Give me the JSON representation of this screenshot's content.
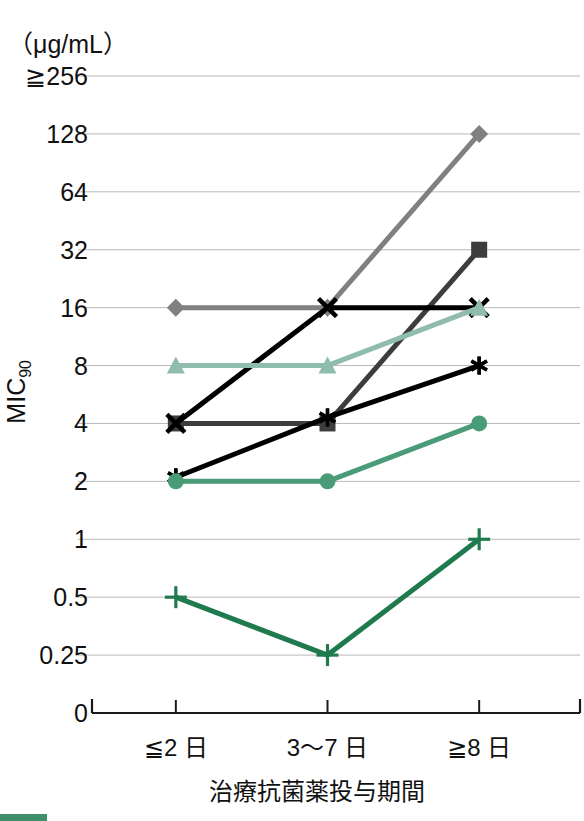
{
  "axis": {
    "unit_label": "（μg/mL）",
    "y_title": "MIC",
    "y_title_sub": "90",
    "x_title": "治療抗菌薬投与期間"
  },
  "chart_data": {
    "type": "line",
    "title": "",
    "xlabel": "治療抗菌薬投与期間",
    "ylabel": "MIC90",
    "unit": "μg/mL",
    "categories": [
      "≦2 日",
      "3〜7 日",
      "≧8 日"
    ],
    "y_scale": "log2",
    "y_ticks": [
      "≧256",
      "128",
      "64",
      "32",
      "16",
      "8",
      "4",
      "2",
      "1",
      "0.5",
      "0.25",
      "0"
    ],
    "y_tick_values": [
      256,
      128,
      64,
      32,
      16,
      8,
      4,
      2,
      1,
      0.5,
      0.25,
      0
    ],
    "grid": true,
    "legend": "none",
    "series": [
      {
        "name": "series-diamond-gray",
        "marker": "diamond",
        "color": "#808080",
        "values": [
          16,
          16,
          128
        ]
      },
      {
        "name": "series-square-darkgray",
        "marker": "square",
        "color": "#3d3d3d",
        "values": [
          4,
          4,
          32
        ]
      },
      {
        "name": "series-x-black",
        "marker": "x",
        "color": "#000000",
        "values": [
          4,
          16,
          16
        ]
      },
      {
        "name": "series-triangle-sage",
        "marker": "triangle",
        "color": "#8fbcab",
        "values": [
          8,
          8,
          16
        ]
      },
      {
        "name": "series-asterisk-black",
        "marker": "asterisk",
        "color": "#000000",
        "values": [
          2.1,
          4.3,
          8
        ]
      },
      {
        "name": "series-circle-green",
        "marker": "circle",
        "color": "#4a9b77",
        "values": [
          2,
          2,
          4
        ]
      },
      {
        "name": "series-plus-darkgreen",
        "marker": "plus",
        "color": "#1f7a4d",
        "values": [
          0.5,
          0.25,
          1
        ]
      }
    ]
  }
}
